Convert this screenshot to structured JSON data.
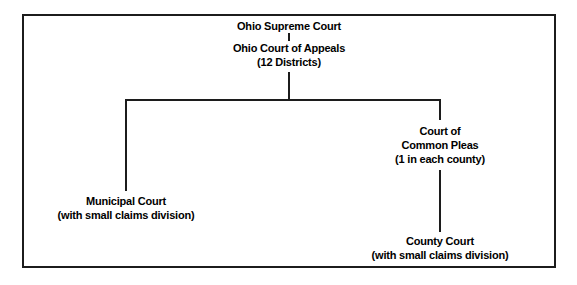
{
  "diagram": {
    "background_color": "#ffffff",
    "line_color": "#1c1c1c",
    "text_color": "#000000",
    "border": {
      "name": "outer-frame",
      "color": "#1c1c1c",
      "width_px": 2
    },
    "nodes": [
      {
        "id": "supreme-court",
        "lines": [
          "Ohio Supreme Court"
        ],
        "center_x": 289,
        "top_y": 19
      },
      {
        "id": "court-of-appeals",
        "lines": [
          "Ohio Court of Appeals",
          "(12 Districts)"
        ],
        "center_x": 289,
        "top_y": 41
      },
      {
        "id": "court-of-common-pleas",
        "lines": [
          "Court of",
          "Common Pleas",
          "(1 in each county)"
        ],
        "center_x": 440,
        "top_y": 124
      },
      {
        "id": "municipal-court",
        "lines": [
          "Municipal Court",
          "(with small claims division)"
        ],
        "center_x": 126,
        "top_y": 194
      },
      {
        "id": "county-court",
        "lines": [
          "County Court",
          "(with small claims division)"
        ],
        "center_x": 440,
        "top_y": 234
      }
    ],
    "connectors": [
      {
        "id": "supreme-to-appeals-tick",
        "type": "vertical",
        "x": 289,
        "y": 33,
        "length": 8
      },
      {
        "id": "appeals-to-bracket-stem",
        "type": "vertical",
        "x": 289,
        "y": 72,
        "length": 28
      },
      {
        "id": "split-bracket",
        "type": "horizontal",
        "x": 126,
        "y": 99,
        "length": 316
      },
      {
        "id": "bracket-to-municipal",
        "type": "vertical",
        "x": 126,
        "y": 99,
        "length": 92
      },
      {
        "id": "bracket-to-common-pleas",
        "type": "vertical",
        "x": 440,
        "y": 99,
        "length": 21
      },
      {
        "id": "common-pleas-to-county",
        "type": "vertical",
        "x": 440,
        "y": 170,
        "length": 62
      }
    ]
  }
}
